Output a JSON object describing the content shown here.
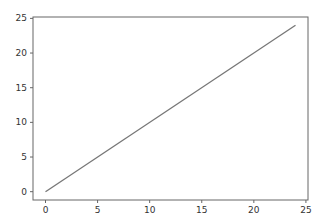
{
  "chart_data": {
    "type": "line",
    "title": "",
    "xlabel": "",
    "ylabel": "",
    "xlim": [
      -1.2,
      25.2
    ],
    "ylim": [
      -1.2,
      25.2
    ],
    "grid": false,
    "legend": null,
    "x_ticks": [
      "0",
      "5",
      "10",
      "15",
      "20",
      "25"
    ],
    "y_ticks": [
      "0",
      "5",
      "10",
      "15",
      "20",
      "25"
    ],
    "series": [
      {
        "name": "line",
        "color": "#777777",
        "x": [
          0,
          24
        ],
        "y": [
          0,
          24
        ]
      }
    ]
  },
  "colors": {
    "line": "#777777",
    "axes": "#666666",
    "background": "#ffffff"
  }
}
